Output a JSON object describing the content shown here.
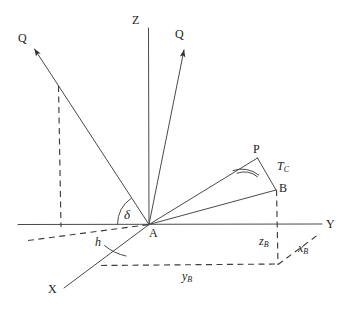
{
  "figure": {
    "kind": "geometry-diagram",
    "background": "#ffffff",
    "stroke": "#3a3a3a",
    "text_color": "#1b1b1b",
    "axes": {
      "z_label": "Z",
      "x_label": "X",
      "y_label": "Y"
    },
    "points": {
      "origin_label": "A",
      "p_label": "P",
      "b_label": "B",
      "q_left_label": "Q",
      "q_right_label": "Q"
    },
    "angles": {
      "delta": "δ",
      "h": "h",
      "tc_base": "T",
      "tc_sub": "C"
    },
    "components": {
      "x_base": "x",
      "x_sub": "B",
      "y_base": "y",
      "y_sub": "B",
      "z_base": "z",
      "z_sub": "B"
    }
  }
}
